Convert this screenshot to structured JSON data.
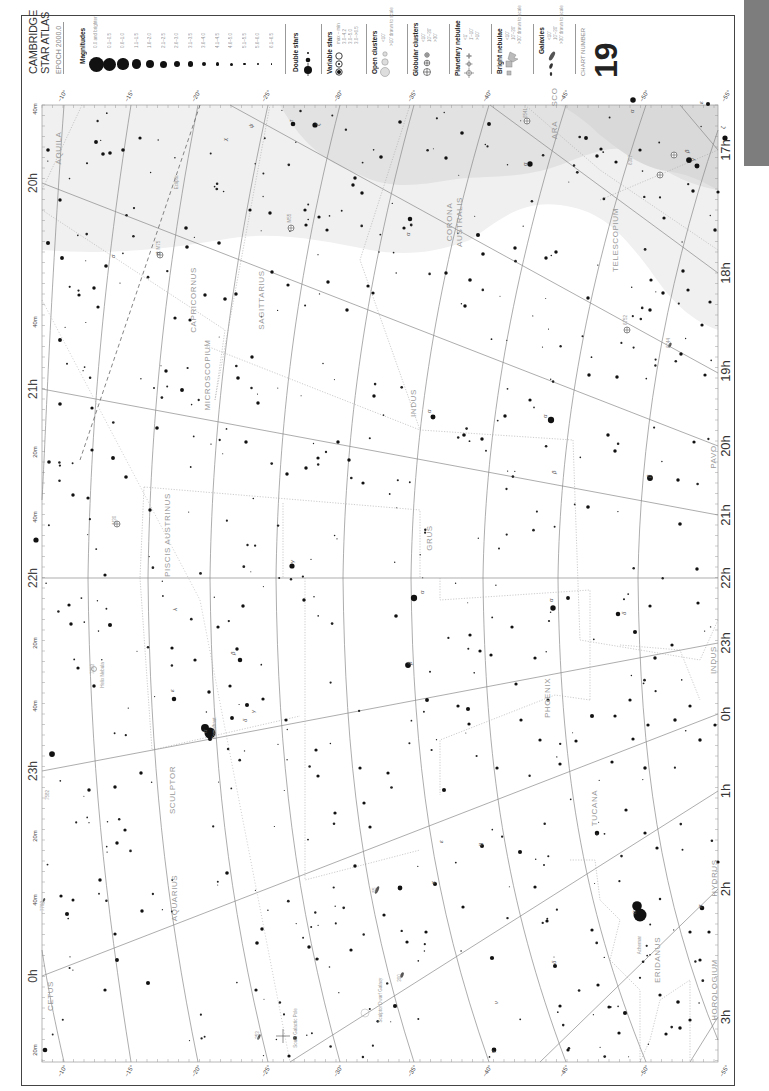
{
  "atlas": {
    "title_line1": "CAMBRIDGE",
    "title_line2": "STAR ATLAS",
    "epoch": "EPOCH 2000.0",
    "chart_number_label": "CHART NUMBER",
    "chart_number": "19"
  },
  "legend": {
    "magnitudes": {
      "heading": "Magnitudes",
      "items": [
        {
          "label": "0.0 and brighter",
          "r": 7.5
        },
        {
          "label": "0.1–0.5",
          "r": 6.5
        },
        {
          "label": "0.6–1.0",
          "r": 5.6
        },
        {
          "label": "1.1–1.5",
          "r": 4.8
        },
        {
          "label": "1.6–2.0",
          "r": 4.1
        },
        {
          "label": "2.1–2.5",
          "r": 3.5
        },
        {
          "label": "2.6–3.0",
          "r": 3.0
        },
        {
          "label": "3.1–3.5",
          "r": 2.6
        },
        {
          "label": "3.6–4.0",
          "r": 2.2
        },
        {
          "label": "4.1–4.5",
          "r": 1.8
        },
        {
          "label": "4.6–5.0",
          "r": 1.5
        },
        {
          "label": "5.1–5.5",
          "r": 1.2
        },
        {
          "label": "5.6–6.0",
          "r": 0.9
        },
        {
          "label": "6.1–6.5",
          "r": 0.7
        }
      ]
    },
    "double_stars": {
      "heading": "Double stars"
    },
    "variable_stars": {
      "heading": "Variable stars",
      "subheading": "max – min",
      "items": [
        "3.0–4.2",
        "3.0–5.0",
        "3.0–>6.5"
      ]
    },
    "open_clusters": {
      "heading": "Open clusters",
      "items": [
        "<10'",
        ">10' drawn to scale"
      ]
    },
    "globular_clusters": {
      "heading": "Globular clusters",
      "items": [
        "<10'",
        "10'–30'",
        ">30'"
      ]
    },
    "planetary_nebulae": {
      "heading": "Planetary nebulae",
      "items": [
        "<1'",
        "1'–10'",
        ">10'"
      ]
    },
    "bright_nebulae": {
      "heading": "Bright nebulae",
      "items": [
        "<10'",
        "10'–30'",
        ">30' drawn to scale"
      ]
    },
    "galaxies": {
      "heading": "Galaxies",
      "items": [
        "<10'",
        "10'–30'",
        ">30' drawn to scale"
      ]
    }
  },
  "map": {
    "ra_labels_right": [
      {
        "text": "17h",
        "y": 150
      },
      {
        "text": "18h",
        "y": 273
      },
      {
        "text": "19h",
        "y": 371
      },
      {
        "text": "20h",
        "y": 446
      },
      {
        "text": "21h",
        "y": 515
      },
      {
        "text": "22h",
        "y": 578
      },
      {
        "text": "23h",
        "y": 643
      },
      {
        "text": "0h",
        "y": 714
      },
      {
        "text": "1h",
        "y": 791
      },
      {
        "text": "2h",
        "y": 889
      },
      {
        "text": "3h",
        "y": 1017
      }
    ],
    "ra_labels_left": [
      {
        "text": "20h",
        "y": 183
      },
      {
        "text": "40m",
        "y": 109
      },
      {
        "text": "40m",
        "y": 322
      },
      {
        "text": "21h",
        "y": 389
      },
      {
        "text": "20m",
        "y": 452
      },
      {
        "text": "40m",
        "y": 517
      },
      {
        "text": "22h",
        "y": 578
      },
      {
        "text": "20m",
        "y": 643
      },
      {
        "text": "40m",
        "y": 706
      },
      {
        "text": "23h",
        "y": 771
      },
      {
        "text": "20m",
        "y": 836
      },
      {
        "text": "40m",
        "y": 900
      },
      {
        "text": "0h",
        "y": 976
      },
      {
        "text": "20m",
        "y": 1050
      }
    ],
    "dec_labels_top": [
      {
        "text": "−10°",
        "x": 64
      },
      {
        "text": "−15°",
        "x": 131
      },
      {
        "text": "−20°",
        "x": 198
      },
      {
        "text": "−25°",
        "x": 268
      },
      {
        "text": "−30°",
        "x": 340
      },
      {
        "text": "−35°",
        "x": 414
      },
      {
        "text": "−40°",
        "x": 489
      },
      {
        "text": "−45°",
        "x": 566
      },
      {
        "text": "−50°",
        "x": 646
      },
      {
        "text": "−55°",
        "x": 728
      }
    ],
    "dec_labels_bottom": [
      {
        "text": "−10°",
        "x": 64
      },
      {
        "text": "−15°",
        "x": 131
      },
      {
        "text": "−20°",
        "x": 198
      },
      {
        "text": "−25°",
        "x": 268
      },
      {
        "text": "−30°",
        "x": 340
      },
      {
        "text": "−35°",
        "x": 414
      },
      {
        "text": "−40°",
        "x": 489
      },
      {
        "text": "−45°",
        "x": 566
      },
      {
        "text": "−50°",
        "x": 646
      },
      {
        "text": "−55°",
        "x": 726
      }
    ],
    "constellations": [
      {
        "name": "AQUILA",
        "x": 61,
        "y": 148
      },
      {
        "name": "CAPRICORNUS",
        "x": 196,
        "y": 300
      },
      {
        "name": "SAGITTARIUS",
        "x": 264,
        "y": 300
      },
      {
        "name": "MICROSCOPIUM",
        "x": 210,
        "y": 375
      },
      {
        "name": "INDUS",
        "x": 416,
        "y": 403
      },
      {
        "name": "CORONA",
        "x": 452,
        "y": 222
      },
      {
        "name": "AUSTRALIS",
        "x": 462,
        "y": 222
      },
      {
        "name": "ARA",
        "x": 557,
        "y": 130
      },
      {
        "name": "SCO",
        "x": 557,
        "y": 97
      },
      {
        "name": "TELESCOPIUM",
        "x": 618,
        "y": 240
      },
      {
        "name": "PISCIS AUSTRINUS",
        "x": 170,
        "y": 535
      },
      {
        "name": "GRUS",
        "x": 432,
        "y": 538
      },
      {
        "name": "PAVO",
        "x": 716,
        "y": 457
      },
      {
        "name": "SCULPTOR",
        "x": 175,
        "y": 790
      },
      {
        "name": "PHOENIX",
        "x": 550,
        "y": 698
      },
      {
        "name": "INDUS",
        "x": 716,
        "y": 660
      },
      {
        "name": "TUCANA",
        "x": 597,
        "y": 808
      },
      {
        "name": "AQUARIUS",
        "x": 177,
        "y": 898
      },
      {
        "name": "CETUS",
        "x": 53,
        "y": 996
      },
      {
        "name": "ERIDANUS",
        "x": 660,
        "y": 960
      },
      {
        "name": "HYDRUS",
        "x": 717,
        "y": 878
      },
      {
        "name": "HOROLOGIUM",
        "x": 717,
        "y": 990
      }
    ],
    "named_objects": [
      {
        "text": "Fomalhaut",
        "x": 216,
        "y": 728
      },
      {
        "text": "Achernar",
        "x": 641,
        "y": 945
      },
      {
        "text": "Helix Nebula",
        "x": 104,
        "y": 675
      },
      {
        "text": "Sculptor Dwarf Galaxy",
        "x": 382,
        "y": 1000
      },
      {
        "text": "South Galactic Pole",
        "x": 297,
        "y": 1028
      },
      {
        "text": "Ecliptic",
        "x": 178,
        "y": 182
      },
      {
        "text": "M55",
        "x": 291,
        "y": 218
      },
      {
        "text": "M75",
        "x": 160,
        "y": 245
      },
      {
        "text": "M30",
        "x": 116,
        "y": 520
      },
      {
        "text": "6752",
        "x": 627,
        "y": 320
      },
      {
        "text": "6744",
        "x": 670,
        "y": 343
      },
      {
        "text": "6397",
        "x": 632,
        "y": 160
      },
      {
        "text": "6541",
        "x": 527,
        "y": 113
      },
      {
        "text": "253",
        "x": 259,
        "y": 1035
      },
      {
        "text": "55",
        "x": 376,
        "y": 890
      },
      {
        "text": "300",
        "x": 401,
        "y": 978
      },
      {
        "text": "7793",
        "x": 44,
        "y": 906
      },
      {
        "text": "7582",
        "x": 49,
        "y": 795
      },
      {
        "text": "7293",
        "x": 94,
        "y": 669
      }
    ],
    "greek_labels": [
      {
        "t": "α",
        "x": 207,
        "y": 733
      },
      {
        "t": "β",
        "x": 235,
        "y": 655
      },
      {
        "t": "γ",
        "x": 255,
        "y": 713
      },
      {
        "t": "δ",
        "x": 247,
        "y": 722
      },
      {
        "t": "ε",
        "x": 174,
        "y": 692
      },
      {
        "t": "λ",
        "x": 177,
        "y": 611
      },
      {
        "t": "α",
        "x": 424,
        "y": 594
      },
      {
        "t": "β",
        "x": 412,
        "y": 665
      },
      {
        "t": "γ",
        "x": 294,
        "y": 563
      },
      {
        "t": "α",
        "x": 553,
        "y": 602
      },
      {
        "t": "δ",
        "x": 626,
        "y": 615
      },
      {
        "t": "α",
        "x": 547,
        "y": 418
      },
      {
        "t": "β",
        "x": 556,
        "y": 474
      },
      {
        "t": "α",
        "x": 431,
        "y": 413
      },
      {
        "t": "β",
        "x": 651,
        "y": 478
      },
      {
        "t": "α",
        "x": 636,
        "y": 914
      },
      {
        "t": "α",
        "x": 702,
        "y": 908
      },
      {
        "t": "α",
        "x": 527,
        "y": 166
      },
      {
        "t": "α",
        "x": 634,
        "y": 113
      },
      {
        "t": "β",
        "x": 689,
        "y": 153
      },
      {
        "t": "γ",
        "x": 695,
        "y": 161
      },
      {
        "t": "ζ",
        "x": 725,
        "y": 129
      },
      {
        "t": "ε",
        "x": 703,
        "y": 104
      },
      {
        "t": "α",
        "x": 410,
        "y": 236
      },
      {
        "t": "τ",
        "x": 293,
        "y": 122
      },
      {
        "t": "ζ",
        "x": 320,
        "y": 126
      },
      {
        "t": "σ",
        "x": 115,
        "y": 258
      },
      {
        "t": "ψ",
        "x": 253,
        "y": 128
      },
      {
        "t": "χ",
        "x": 227,
        "y": 141
      },
      {
        "t": "θ",
        "x": 160,
        "y": 255
      },
      {
        "t": "η",
        "x": 482,
        "y": 846
      },
      {
        "t": "ν",
        "x": 498,
        "y": 1004
      },
      {
        "t": "γ",
        "x": 495,
        "y": 1053
      },
      {
        "t": "δ",
        "x": 556,
        "y": 964
      },
      {
        "t": "κ",
        "x": 435,
        "y": 884
      },
      {
        "t": "ε",
        "x": 443,
        "y": 843
      }
    ]
  },
  "chart_data": {
    "type": "scatter",
    "xlabel": "Declination",
    "ylabel": "Right Ascension",
    "ra_range": [
      "17h",
      "3h"
    ],
    "dec_range": [
      "−10°",
      "−60°"
    ],
    "grid": true
  }
}
